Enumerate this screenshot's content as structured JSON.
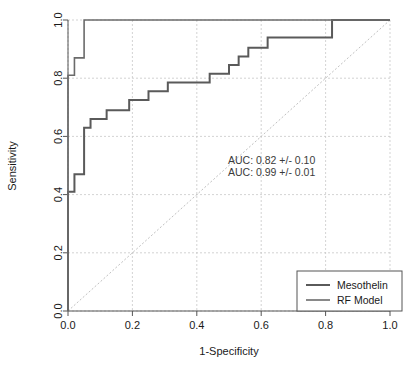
{
  "chart_data": {
    "type": "line",
    "title": "",
    "xlabel": "1-Specificity",
    "ylabel": "Sensitivity",
    "xlim": [
      0,
      1
    ],
    "ylim": [
      0,
      1
    ],
    "xticks": [
      "0.0",
      "0.2",
      "0.4",
      "0.6",
      "0.8",
      "1.0"
    ],
    "yticks": [
      "0.0",
      "0.2",
      "0.4",
      "0.6",
      "0.8",
      "1.0"
    ],
    "xtick_values": [
      0,
      0.2,
      0.4,
      0.6,
      0.8,
      1
    ],
    "ytick_values": [
      0,
      0.2,
      0.4,
      0.6,
      0.8,
      1
    ],
    "grid": true,
    "grid_style": "dashed",
    "grid_color": "#c8c8c8",
    "legend_position": "bottom-right",
    "reference_line": {
      "name": "chance-diagonal",
      "from": [
        0,
        0
      ],
      "to": [
        1,
        1
      ],
      "style": "dashed",
      "color": "#c0c0c0"
    },
    "annotations": [
      "AUC: 0.82 +/- 0.10",
      "AUC: 0.99 +/- 0.01"
    ],
    "series": [
      {
        "name": "Mesothelin",
        "auc": "0.82",
        "auc_sd": "0.10",
        "color": "#5a5a5a",
        "linewidth": 2.0,
        "points": [
          [
            0.0,
            0.0
          ],
          [
            0.0,
            0.41
          ],
          [
            0.02,
            0.41
          ],
          [
            0.02,
            0.47
          ],
          [
            0.05,
            0.47
          ],
          [
            0.05,
            0.63
          ],
          [
            0.07,
            0.63
          ],
          [
            0.07,
            0.66
          ],
          [
            0.12,
            0.66
          ],
          [
            0.12,
            0.69
          ],
          [
            0.19,
            0.69
          ],
          [
            0.19,
            0.725
          ],
          [
            0.25,
            0.725
          ],
          [
            0.25,
            0.755
          ],
          [
            0.31,
            0.755
          ],
          [
            0.31,
            0.785
          ],
          [
            0.44,
            0.785
          ],
          [
            0.44,
            0.815
          ],
          [
            0.5,
            0.815
          ],
          [
            0.5,
            0.845
          ],
          [
            0.53,
            0.845
          ],
          [
            0.53,
            0.875
          ],
          [
            0.56,
            0.875
          ],
          [
            0.56,
            0.905
          ],
          [
            0.62,
            0.905
          ],
          [
            0.62,
            0.94
          ],
          [
            0.82,
            0.94
          ],
          [
            0.82,
            1.0
          ],
          [
            1.0,
            1.0
          ]
        ]
      },
      {
        "name": "RF Model",
        "auc": "0.99",
        "auc_sd": "0.01",
        "color": "#6b6b6b",
        "linewidth": 1.6,
        "points": [
          [
            0.0,
            0.0
          ],
          [
            0.0,
            0.81
          ],
          [
            0.02,
            0.81
          ],
          [
            0.02,
            0.87
          ],
          [
            0.05,
            0.87
          ],
          [
            0.05,
            1.0
          ],
          [
            1.0,
            1.0
          ]
        ]
      }
    ],
    "legend": {
      "entries": [
        {
          "label": "Mesothelin",
          "color": "#5a5a5a",
          "linewidth": 2.0
        },
        {
          "label": "RF Model",
          "color": "#6b6b6b",
          "linewidth": 1.6
        }
      ]
    }
  }
}
